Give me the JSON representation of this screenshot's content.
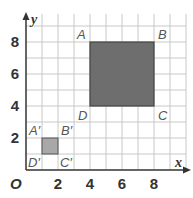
{
  "figure": {
    "axes": {
      "x_label": "x",
      "y_label": "y",
      "origin_label": "O",
      "x_ticks": [
        "2",
        "4",
        "6",
        "8"
      ],
      "y_ticks": [
        "2",
        "4",
        "6",
        "8"
      ]
    },
    "original_square": {
      "vertices": {
        "A": [
          4,
          8
        ],
        "B": [
          8,
          8
        ],
        "C": [
          8,
          4
        ],
        "D": [
          4,
          4
        ]
      },
      "labels": {
        "A": "A",
        "B": "B",
        "C": "C",
        "D": "D"
      },
      "fill": "#6e6e6e"
    },
    "image_square": {
      "vertices": {
        "A'": [
          1,
          2
        ],
        "B'": [
          2,
          2
        ],
        "C'": [
          2,
          1
        ],
        "D'": [
          1,
          1
        ]
      },
      "labels": {
        "A": "A′",
        "B": "B′",
        "C": "C′",
        "D": "D′"
      },
      "fill": "#a8a8a8"
    },
    "colors": {
      "grid": "#c8c8c8",
      "axis": "#333333",
      "large_square": "#6e6e6e",
      "small_square": "#a8a8a8"
    }
  }
}
